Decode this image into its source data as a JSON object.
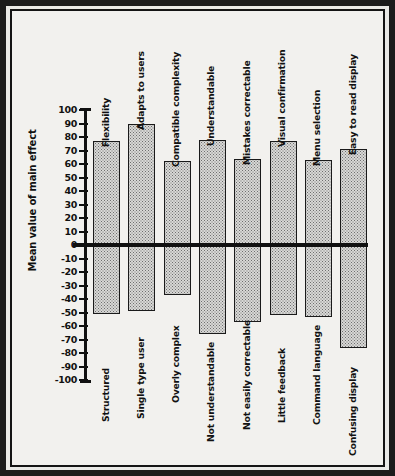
{
  "figure": {
    "ylabel": "Mean value of main effect",
    "axis_min": -100,
    "axis_max": 100,
    "tick_labels": [
      "100",
      "90",
      "80",
      "70",
      "60",
      "50",
      "40",
      "30",
      "20",
      "10",
      "0",
      "-10",
      "-20",
      "-30",
      "-40",
      "-50",
      "-60",
      "-70",
      "-80",
      "-90",
      "-100"
    ],
    "colors": {
      "line": "#111111",
      "bar_fill": "#d8d8d6",
      "bar_pattern": "#6e6e6e",
      "frame": "#1b1b1b",
      "page": "#f2f1ee"
    }
  },
  "chart_data": {
    "type": "bar",
    "title": "",
    "xlabel": "",
    "ylabel": "Mean value of main effect",
    "ylim": [
      -100,
      100
    ],
    "grid": false,
    "legend": "none",
    "orientation": "vertical",
    "tick_step": 10,
    "positive_labels": [
      "Flexibility",
      "Adapts to users",
      "Compatible complexity",
      "Understandable",
      "Mistakes correctable",
      "Visual confirmation",
      "Menu selection",
      "Easy to read display"
    ],
    "negative_labels": [
      "Structured",
      "Single type user",
      "Overly complex",
      "Not understandable",
      "Not easily correctable",
      "Little feedback",
      "Command language",
      "Confusing display"
    ],
    "positive_values": [
      77,
      90,
      62,
      78,
      64,
      77,
      63,
      71
    ],
    "negative_values": [
      -51,
      -49,
      -37,
      -66,
      -57,
      -52,
      -53,
      -76
    ],
    "bars": [
      {
        "top_label": "Flexibility",
        "bottom_label": "Structured",
        "positive": 77,
        "negative": -51
      },
      {
        "top_label": "Adapts to users",
        "bottom_label": "Single type user",
        "positive": 90,
        "negative": -49
      },
      {
        "top_label": "Compatible complexity",
        "bottom_label": "Overly complex",
        "positive": 62,
        "negative": -37
      },
      {
        "top_label": "Understandable",
        "bottom_label": "Not understandable",
        "positive": 78,
        "negative": -66
      },
      {
        "top_label": "Mistakes correctable",
        "bottom_label": "Not easily correctable",
        "positive": 64,
        "negative": -57
      },
      {
        "top_label": "Visual confirmation",
        "bottom_label": "Little feedback",
        "positive": 77,
        "negative": -52
      },
      {
        "top_label": "Menu selection",
        "bottom_label": "Command language",
        "positive": 63,
        "negative": -53
      },
      {
        "top_label": "Easy to read display",
        "bottom_label": "Confusing display",
        "positive": 71,
        "negative": -76
      }
    ]
  }
}
